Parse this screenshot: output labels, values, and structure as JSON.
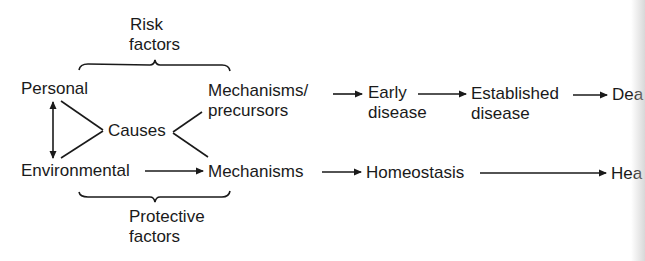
{
  "diagram": {
    "braces": {
      "top": {
        "label_line1": "Risk",
        "label_line2": "factors"
      },
      "bottom": {
        "label_line1": "Protective",
        "label_line2": "factors"
      }
    },
    "nodes": {
      "personal": "Personal",
      "environmental": "Environmental",
      "causes": "Causes",
      "mechanisms_precursors_line1": "Mechanisms/",
      "mechanisms_precursors_line2": "precursors",
      "mechanisms": "Mechanisms",
      "early_disease_line1": "Early",
      "early_disease_line2": "disease",
      "established_disease_line1": "Established",
      "established_disease_line2": "disease",
      "death_truncated": "Dea",
      "homeostasis": "Homeostasis",
      "health_truncated": "Hea"
    },
    "edges": [
      {
        "from": "Personal",
        "to": "Environmental",
        "type": "bidirectional"
      },
      {
        "from": "Personal",
        "to": "Causes",
        "type": "line"
      },
      {
        "from": "Environmental",
        "to": "Causes",
        "type": "line"
      },
      {
        "from": "Causes",
        "to": "Mechanisms/precursors",
        "type": "line"
      },
      {
        "from": "Causes",
        "to": "Mechanisms",
        "type": "line"
      },
      {
        "from": "Mechanisms/precursors",
        "to": "Early disease",
        "type": "arrow"
      },
      {
        "from": "Early disease",
        "to": "Established disease",
        "type": "arrow"
      },
      {
        "from": "Established disease",
        "to": "Death",
        "type": "arrow"
      },
      {
        "from": "Environmental",
        "to": "Mechanisms",
        "type": "arrow"
      },
      {
        "from": "Mechanisms",
        "to": "Homeostasis",
        "type": "arrow"
      },
      {
        "from": "Homeostasis",
        "to": "Health",
        "type": "arrow"
      }
    ]
  }
}
